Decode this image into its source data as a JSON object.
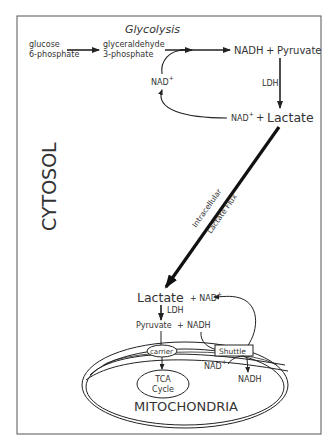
{
  "diagram": {
    "frame_color": "#555555",
    "title": "Glycolysis",
    "compartments": {
      "cytosol": "CYTOSOL",
      "mitochondria": "MITOCHONDRIA"
    },
    "glycolysis": {
      "substrate_line1": "glucose",
      "substrate_line2": "6-phosphate",
      "intermediate_line1": "glyceraldehyde",
      "intermediate_line2": "3-phosphate",
      "nadh": "NADH",
      "plus": "+",
      "pyruvate": "Pyruvate",
      "nad_recycle": "NAD",
      "nad_sup": "+",
      "enzyme": "LDH",
      "nad_out": "NAD",
      "nad_out_sup": "+",
      "plus2": "+",
      "lactate": "Lactate"
    },
    "flux": {
      "label_line1": "Intracellular",
      "label_line2": "Lactate Flux"
    },
    "mito_side": {
      "lactate": "Lactate",
      "plus_nad": "+ NAD",
      "nad_sup": "+",
      "enzyme": "LDH",
      "pyruvate": "Pyruvate",
      "plus": "+",
      "nadh": "NADH",
      "carrier": "carrier",
      "shuttle": "Shuttle",
      "tca_line1": "TCA",
      "tca_line2": "Cycle",
      "inner_nad": "NAD",
      "inner_nad_sup": "+",
      "inner_nadh": "NADH"
    }
  }
}
